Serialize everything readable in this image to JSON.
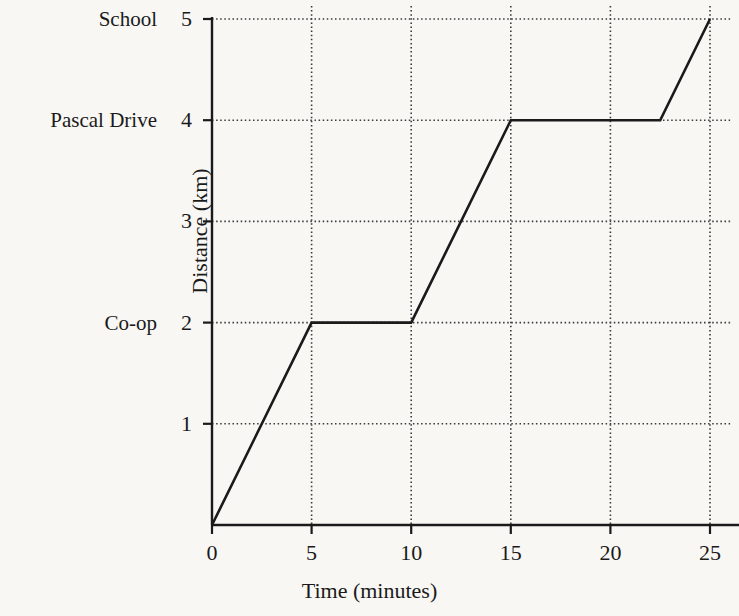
{
  "chart_data": {
    "type": "line",
    "title": "",
    "xlabel": "Time (minutes)",
    "ylabel": "Distance (km)",
    "xlim": [
      0,
      25
    ],
    "ylim": [
      0,
      5
    ],
    "grid": true,
    "legend": "none",
    "x": [
      0,
      5,
      10,
      15,
      22.5,
      25
    ],
    "values": [
      0,
      2,
      2,
      4,
      4,
      5
    ],
    "series": [
      {
        "name": "Journey",
        "points": [
          {
            "x": 0,
            "y": 0
          },
          {
            "x": 5,
            "y": 2
          },
          {
            "x": 10,
            "y": 2
          },
          {
            "x": 15,
            "y": 4
          },
          {
            "x": 22.5,
            "y": 4
          },
          {
            "x": 25,
            "y": 5
          }
        ]
      }
    ],
    "xticks": [
      0,
      5,
      10,
      15,
      20,
      25
    ],
    "xtick_labels": [
      "0",
      "5",
      "10",
      "15",
      "20",
      "25"
    ],
    "yticks": [
      1,
      2,
      3,
      4,
      5
    ],
    "ytick_labels": [
      "1",
      "2",
      "3",
      "4",
      "5"
    ],
    "y_annotations": [
      {
        "value": 5,
        "label": "School"
      },
      {
        "value": 4,
        "label": "Pascal Drive"
      },
      {
        "value": 2,
        "label": "Co-op"
      }
    ],
    "line_color": "#1a1a1a",
    "grid_color": "#3a3a3a",
    "axis_color": "#1a1a1a",
    "background_color": "#f8f7f4"
  }
}
